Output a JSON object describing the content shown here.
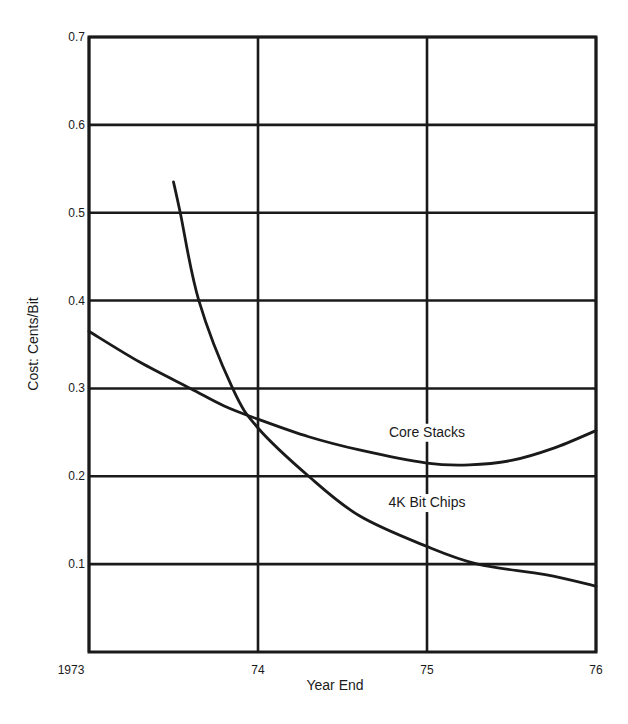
{
  "chart_data": {
    "type": "line",
    "title": "",
    "xlabel": "Year End",
    "ylabel": "Cost:  Cents/Bit",
    "xlim": [
      1973,
      1976
    ],
    "ylim": [
      0,
      0.7
    ],
    "x_ticks": [
      {
        "value": 1973,
        "label": "1973"
      },
      {
        "value": 1974,
        "label": "74"
      },
      {
        "value": 1975,
        "label": "75"
      },
      {
        "value": 1976,
        "label": "76"
      }
    ],
    "y_ticks": [
      {
        "value": 0.1,
        "label": "0.1"
      },
      {
        "value": 0.2,
        "label": "0.2"
      },
      {
        "value": 0.3,
        "label": "0.3"
      },
      {
        "value": 0.4,
        "label": "0.4"
      },
      {
        "value": 0.5,
        "label": "0.5"
      },
      {
        "value": 0.6,
        "label": "0.6"
      },
      {
        "value": 0.7,
        "label": "0.7"
      }
    ],
    "grid": true,
    "legend": "none (inline annotations)",
    "series": [
      {
        "name": "Core Stacks",
        "label_position": {
          "x": 1975.0,
          "y": 0.245
        },
        "points": [
          [
            1973.0,
            0.365
          ],
          [
            1973.3,
            0.33
          ],
          [
            1973.6,
            0.3
          ],
          [
            1973.8,
            0.28
          ],
          [
            1974.0,
            0.265
          ],
          [
            1974.3,
            0.245
          ],
          [
            1974.6,
            0.23
          ],
          [
            1975.0,
            0.215
          ],
          [
            1975.25,
            0.213
          ],
          [
            1975.5,
            0.218
          ],
          [
            1975.75,
            0.232
          ],
          [
            1976.0,
            0.252
          ]
        ]
      },
      {
        "name": "4K Bit Chips",
        "label_position": {
          "x": 1975.0,
          "y": 0.165
        },
        "points": [
          [
            1973.5,
            0.535
          ],
          [
            1973.54,
            0.5
          ],
          [
            1973.65,
            0.4
          ],
          [
            1973.85,
            0.3
          ],
          [
            1974.0,
            0.255
          ],
          [
            1974.3,
            0.2
          ],
          [
            1974.6,
            0.155
          ],
          [
            1975.0,
            0.12
          ],
          [
            1975.3,
            0.1
          ],
          [
            1975.7,
            0.088
          ],
          [
            1976.0,
            0.075
          ]
        ]
      }
    ]
  },
  "plot_area": {
    "left": 89,
    "right": 596,
    "top": 37,
    "bottom": 652
  },
  "colors": {
    "ink": "#1a1a1a",
    "background": "#ffffff"
  }
}
